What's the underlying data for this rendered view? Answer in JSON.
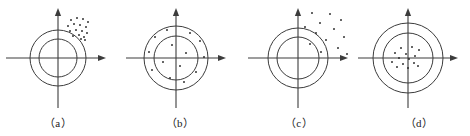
{
  "figure": {
    "background_color": "#ffffff",
    "line_color": "#3c3c3c",
    "point_color": "#262626",
    "width": 470,
    "height": 136
  },
  "panels": [
    {
      "id": "a",
      "caption": "（a）",
      "description": "Points clustered tightly in the upper-right, offset from the center: biased but precise",
      "center": {
        "x": 58,
        "y": 58
      },
      "outer_radius": 28,
      "inner_radius": 19,
      "axis": {
        "x_start": 6,
        "x_end": 106,
        "y_start": 8,
        "y_end": 108,
        "arrow_x": true,
        "arrow_y": true
      },
      "points": [
        {
          "x": 71,
          "y": 20
        },
        {
          "x": 77,
          "y": 18
        },
        {
          "x": 83,
          "y": 19
        },
        {
          "x": 88,
          "y": 22
        },
        {
          "x": 68,
          "y": 26
        },
        {
          "x": 74,
          "y": 24
        },
        {
          "x": 80,
          "y": 25
        },
        {
          "x": 86,
          "y": 27
        },
        {
          "x": 70,
          "y": 31
        },
        {
          "x": 76,
          "y": 30
        },
        {
          "x": 82,
          "y": 31
        },
        {
          "x": 87,
          "y": 33
        },
        {
          "x": 73,
          "y": 36
        },
        {
          "x": 79,
          "y": 35
        },
        {
          "x": 84,
          "y": 37
        },
        {
          "x": 81,
          "y": 39
        },
        {
          "x": 85,
          "y": 40
        }
      ]
    },
    {
      "id": "b",
      "caption": "（b）",
      "description": "Points scattered broadly around the center: unbiased but imprecise",
      "center": {
        "x": 176,
        "y": 58
      },
      "outer_radius": 32,
      "inner_radius": 22,
      "axis": {
        "x_start": 126,
        "x_end": 226,
        "y_start": 8,
        "y_end": 108,
        "arrow_x": true,
        "arrow_y": true
      },
      "points": [
        {
          "x": 167,
          "y": 30
        },
        {
          "x": 190,
          "y": 33
        },
        {
          "x": 155,
          "y": 37
        },
        {
          "x": 200,
          "y": 41
        },
        {
          "x": 172,
          "y": 45
        },
        {
          "x": 149,
          "y": 52
        },
        {
          "x": 186,
          "y": 53
        },
        {
          "x": 204,
          "y": 57
        },
        {
          "x": 163,
          "y": 62
        },
        {
          "x": 180,
          "y": 66
        },
        {
          "x": 152,
          "y": 70
        },
        {
          "x": 196,
          "y": 72
        },
        {
          "x": 170,
          "y": 78
        },
        {
          "x": 184,
          "y": 82
        }
      ]
    },
    {
      "id": "c",
      "caption": "（c）",
      "description": "Points widely scattered in the upper-right, far from the center: biased and imprecise",
      "center": {
        "x": 298,
        "y": 58
      },
      "outer_radius": 30,
      "inner_radius": 21,
      "axis": {
        "x_start": 248,
        "x_end": 348,
        "y_start": 8,
        "y_end": 108,
        "arrow_x": true,
        "arrow_y": true
      },
      "points": [
        {
          "x": 312,
          "y": 13
        },
        {
          "x": 330,
          "y": 14
        },
        {
          "x": 341,
          "y": 20
        },
        {
          "x": 320,
          "y": 23
        },
        {
          "x": 305,
          "y": 27
        },
        {
          "x": 334,
          "y": 29
        },
        {
          "x": 316,
          "y": 33
        },
        {
          "x": 344,
          "y": 37
        },
        {
          "x": 326,
          "y": 40
        },
        {
          "x": 310,
          "y": 44
        },
        {
          "x": 338,
          "y": 48
        },
        {
          "x": 321,
          "y": 52
        },
        {
          "x": 347,
          "y": 54
        }
      ]
    },
    {
      "id": "d",
      "caption": "（d）",
      "description": "Points clustered tightly around the center: unbiased and precise",
      "center": {
        "x": 408,
        "y": 58
      },
      "outer_radius": 35,
      "inner_radius": 25,
      "axis": {
        "x_start": 358,
        "x_end": 458,
        "y_start": 8,
        "y_end": 108,
        "arrow_x": true,
        "arrow_y": true
      },
      "points": [
        {
          "x": 401,
          "y": 48
        },
        {
          "x": 412,
          "y": 47
        },
        {
          "x": 419,
          "y": 50
        },
        {
          "x": 395,
          "y": 53
        },
        {
          "x": 406,
          "y": 54
        },
        {
          "x": 415,
          "y": 56
        },
        {
          "x": 399,
          "y": 58
        },
        {
          "x": 409,
          "y": 59
        },
        {
          "x": 392,
          "y": 62
        },
        {
          "x": 403,
          "y": 64
        },
        {
          "x": 414,
          "y": 63
        },
        {
          "x": 397,
          "y": 67
        },
        {
          "x": 408,
          "y": 68
        },
        {
          "x": 418,
          "y": 66
        }
      ]
    }
  ]
}
